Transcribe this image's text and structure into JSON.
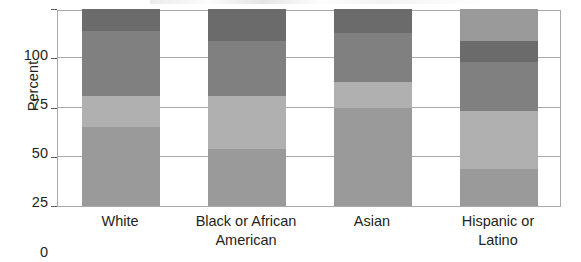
{
  "chart_data": {
    "type": "bar",
    "subtype": "stacked-100-percent",
    "title": "",
    "xlabel": "",
    "ylabel": "Percent",
    "ylim": [
      0,
      100
    ],
    "yticks": [
      0,
      25,
      50,
      75,
      100
    ],
    "ytick_labels": [
      "0",
      "25",
      "50",
      "75",
      "100"
    ],
    "grid": true,
    "grid_axis": "y",
    "legend": false,
    "legend_position": "none",
    "categories": [
      "White",
      "Black or African American",
      "Asian",
      "Hispanic or Latino"
    ],
    "category_label_lines": [
      [
        "White"
      ],
      [
        "Black or African",
        "American"
      ],
      [
        "Asian"
      ],
      [
        "Hispanic or",
        "Latino"
      ]
    ],
    "series": [
      {
        "name": "segment-1",
        "color": "#9a9a9a",
        "values": [
          40,
          29,
          50,
          19
        ]
      },
      {
        "name": "segment-2",
        "color": "#b0b0b0",
        "values": [
          16,
          27,
          13,
          29
        ]
      },
      {
        "name": "segment-3",
        "color": "#808080",
        "values": [
          33,
          28,
          25,
          25
        ]
      },
      {
        "name": "segment-4",
        "color": "#6b6b6b",
        "values": [
          11,
          16,
          12,
          11
        ]
      },
      {
        "name": "segment-5",
        "color": "#9a9a9a",
        "values": [
          0,
          0,
          0,
          16
        ]
      }
    ],
    "cumulative_boundaries": [
      [
        40,
        56,
        89,
        100,
        100
      ],
      [
        29,
        56,
        84,
        100,
        100
      ],
      [
        50,
        63,
        88,
        100,
        100
      ],
      [
        19,
        48,
        73,
        84,
        100
      ]
    ]
  },
  "axis": {
    "y_title": "Percent"
  },
  "colors": {
    "frame": "#a7a9ac",
    "gridline": "#a7a9ac",
    "tick": "#58595b",
    "text": "#231f20",
    "background": "#ffffff"
  }
}
